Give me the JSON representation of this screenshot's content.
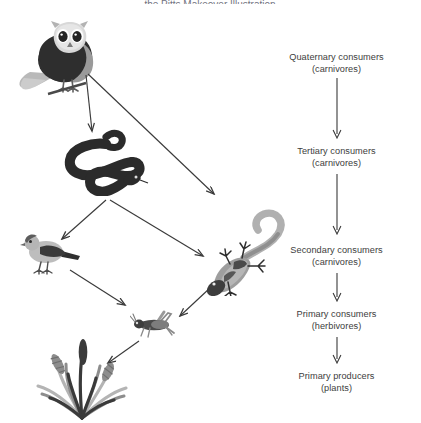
{
  "figure": {
    "top_partial_text": "the Pitts Makeover Illustration",
    "background": "#ffffff",
    "ink": "#3d3d3d"
  },
  "levels": [
    {
      "id": "quaternary",
      "title": "Quaternary consumers",
      "sub": "(carnivores)"
    },
    {
      "id": "tertiary",
      "title": "Tertiary consumers",
      "sub": "(carnivores)"
    },
    {
      "id": "secondary",
      "title": "Secondary consumers",
      "sub": "(carnivores)"
    },
    {
      "id": "primary_consumers",
      "title": "Primary consumers",
      "sub": "(herbivores)"
    },
    {
      "id": "primary_producers",
      "title": "Primary producers",
      "sub": "(plants)"
    }
  ],
  "organisms": [
    {
      "id": "owl",
      "name": "owl",
      "level": "quaternary"
    },
    {
      "id": "snake",
      "name": "snake",
      "level": "tertiary"
    },
    {
      "id": "bird",
      "name": "bird",
      "level": "secondary"
    },
    {
      "id": "lizard",
      "name": "lizard",
      "level": "secondary"
    },
    {
      "id": "grasshopper",
      "name": "grasshopper",
      "level": "primary_consumers"
    },
    {
      "id": "grass",
      "name": "grass",
      "level": "primary_producers"
    }
  ],
  "web_links": [
    {
      "from": "owl",
      "to": "snake"
    },
    {
      "from": "owl",
      "to": "lizard"
    },
    {
      "from": "snake",
      "to": "bird"
    },
    {
      "from": "snake",
      "to": "lizard"
    },
    {
      "from": "bird",
      "to": "grasshopper"
    },
    {
      "from": "lizard",
      "to": "grasshopper"
    },
    {
      "from": "grasshopper",
      "to": "grass"
    }
  ],
  "colors": {
    "dark": "#2f2f2f",
    "mid": "#6e6e6e",
    "light": "#a8a8a8",
    "pale": "#cfcfcf",
    "arrow": "#3a3a3a"
  }
}
